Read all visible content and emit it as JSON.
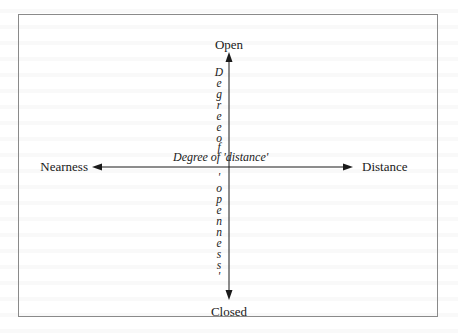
{
  "diagram": {
    "type": "two-axis quadrant diagram",
    "poles": {
      "top": "Open",
      "bottom": "Closed",
      "left": "Nearness",
      "right": "Distance"
    },
    "horizontal_axis_label": "Degree of 'distance'",
    "vertical_axis_label": {
      "full": "Degree of 'openness'",
      "segment_top": [
        "D",
        "e",
        "g",
        "r",
        "e",
        "e"
      ],
      "segment_mid": [
        "o",
        "f"
      ],
      "segment_bottom": [
        "'",
        "o",
        "p",
        "e",
        "n",
        "n",
        "e",
        "s",
        "s",
        "'"
      ]
    },
    "colors": {
      "ink": "#1a1a1a",
      "frame": "#8a8a8a",
      "background": "#ffffff"
    }
  }
}
